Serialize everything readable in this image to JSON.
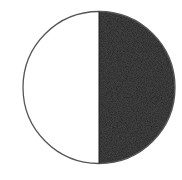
{
  "diagram": {
    "type": "half-shaded-circle",
    "colors": {
      "background": "#ffffff",
      "left_half": "#ffffff",
      "right_half": "#1e1e1e",
      "outline": "#555555"
    },
    "geometry": {
      "cx": 99,
      "cy": 87.5,
      "r": 76
    }
  }
}
